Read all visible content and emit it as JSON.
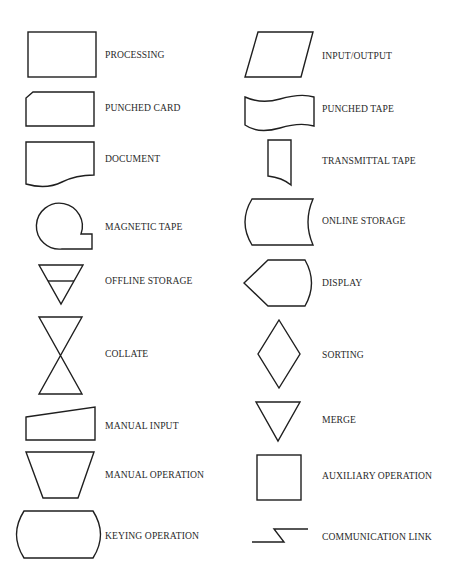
{
  "diagram": {
    "type": "flowchart-symbol-legend",
    "left_column": [
      {
        "id": "processing",
        "label": "PROCESSING",
        "shape": "rectangle"
      },
      {
        "id": "punched-card",
        "label": "PUNCHED CARD",
        "shape": "rectangle-clipped-corner"
      },
      {
        "id": "document",
        "label": "DOCUMENT",
        "shape": "wavy-bottom-rectangle"
      },
      {
        "id": "magnetic-tape",
        "label": "MAGNETIC TAPE",
        "shape": "circle-with-tail"
      },
      {
        "id": "offline-storage",
        "label": "OFFLINE STORAGE",
        "shape": "inverted-triangle-with-bar"
      },
      {
        "id": "collate",
        "label": "COLLATE",
        "shape": "hourglass"
      },
      {
        "id": "manual-input",
        "label": "MANUAL INPUT",
        "shape": "sloped-top-quad"
      },
      {
        "id": "manual-operation",
        "label": "MANUAL OPERATION",
        "shape": "inverted-trapezoid"
      },
      {
        "id": "keying-operation",
        "label": "KEYING OPERATION",
        "shape": "curved-side-rectangle"
      }
    ],
    "right_column": [
      {
        "id": "input-output",
        "label": "INPUT/OUTPUT",
        "shape": "parallelogram"
      },
      {
        "id": "punched-tape",
        "label": "PUNCHED TAPE",
        "shape": "wavy-banner"
      },
      {
        "id": "transmittal-tape",
        "label": "TRANSMITTAL TAPE",
        "shape": "narrow-rect-curved-bottom"
      },
      {
        "id": "online-storage",
        "label": "ONLINE STORAGE",
        "shape": "drum-side"
      },
      {
        "id": "display",
        "label": "DISPLAY",
        "shape": "pointed-left-curved-right"
      },
      {
        "id": "sorting",
        "label": "SORTING",
        "shape": "diamond"
      },
      {
        "id": "merge",
        "label": "MERGE",
        "shape": "inverted-triangle"
      },
      {
        "id": "auxiliary-operation",
        "label": "AUXILIARY OPERATION",
        "shape": "square"
      },
      {
        "id": "communication-link",
        "label": "COMMUNICATION LINK",
        "shape": "lightning-line"
      }
    ]
  },
  "colors": {
    "stroke": "#1f1f1f",
    "text": "#2a2a2a",
    "background": "#ffffff"
  }
}
